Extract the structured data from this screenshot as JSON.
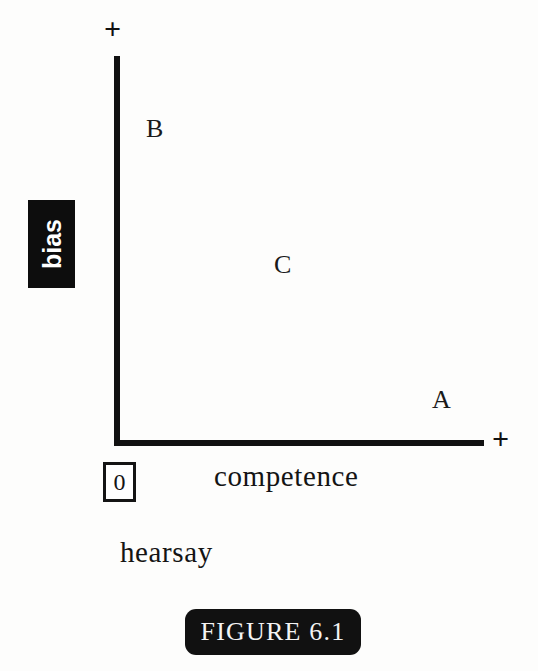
{
  "figure": {
    "caption": "FIGURE 6.1",
    "caption_bg": "#111111",
    "caption_fg": "#f4f4f4"
  },
  "chart_data": {
    "type": "scatter",
    "title": "FIGURE 6.1",
    "xlabel": "competence",
    "ylabel": "bias",
    "sublabel": "hearsay",
    "origin_label": "0",
    "x_axis_end_marker": "+",
    "y_axis_end_marker": "+",
    "grid": false,
    "legend": null,
    "axis_color": "#111111",
    "ylabel_style": {
      "rotated": true,
      "text_color": "#ffffff",
      "background": "#0d0d0d"
    },
    "xlim": [
      0,
      1
    ],
    "ylim": [
      0,
      1
    ],
    "annotations": [
      {
        "label": "B",
        "x": 0.09,
        "y": 0.83
      },
      {
        "label": "C",
        "x": 0.44,
        "y": 0.48
      },
      {
        "label": "A",
        "x": 0.87,
        "y": 0.14
      }
    ]
  },
  "axes": {
    "y": {
      "marker": "+",
      "label": "bias"
    },
    "x": {
      "marker": "+",
      "label": "competence"
    },
    "origin": "0",
    "note": "hearsay"
  },
  "points": {
    "b": "B",
    "c": "C",
    "a": "A"
  }
}
